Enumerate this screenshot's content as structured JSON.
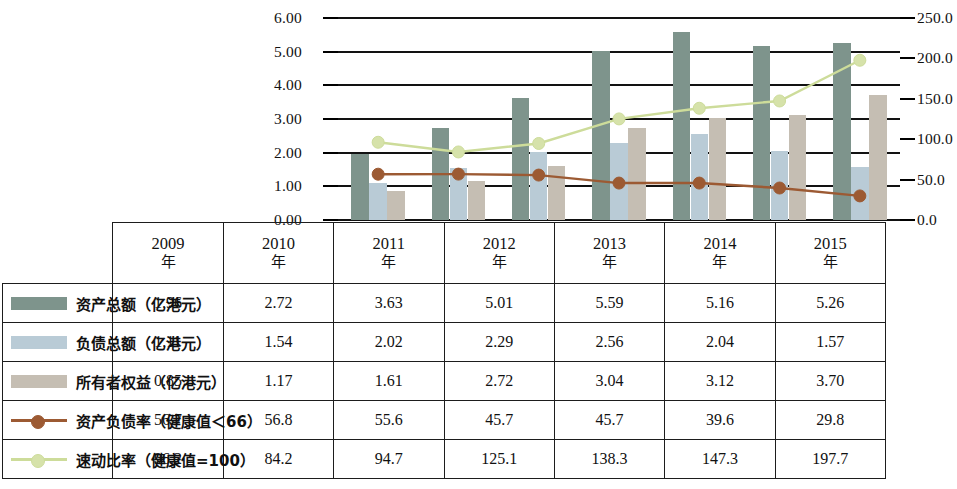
{
  "chart_data": {
    "type": "bar",
    "title": "",
    "xlabel": "",
    "ylabel": "",
    "grid": true,
    "legend_position": "table-left",
    "categories": [
      "2009年",
      "2010年",
      "2011年",
      "2012年",
      "2013年",
      "2014年",
      "2015年"
    ],
    "year_numbers": [
      "2009",
      "2010",
      "2011",
      "2012",
      "2013",
      "2014",
      "2015"
    ],
    "year_suffix": "年",
    "axes": {
      "left": {
        "min": 0,
        "max": 6,
        "step": 1,
        "ticks": [
          "0.00",
          "1.00",
          "2.00",
          "3.00",
          "4.00",
          "5.00",
          "6.00"
        ]
      },
      "right": {
        "min": 0,
        "max": 250,
        "step": 50,
        "ticks": [
          "0.0",
          "50.0",
          "100.0",
          "150.0",
          "200.0",
          "250.0"
        ]
      }
    },
    "series": [
      {
        "name": "资产总额（亿港元）",
        "kind": "bar",
        "axis": "left",
        "color": "#7e948c",
        "values": [
          1.96,
          2.72,
          3.63,
          5.01,
          5.59,
          5.16,
          5.26
        ],
        "labels": [
          "1.96",
          "2.72",
          "3.63",
          "5.01",
          "5.59",
          "5.16",
          "5.26"
        ]
      },
      {
        "name": "负债总额（亿港元）",
        "kind": "bar",
        "axis": "left",
        "color": "#b9cbd6",
        "values": [
          1.11,
          1.54,
          2.02,
          2.29,
          2.56,
          2.04,
          1.57
        ],
        "labels": [
          "1.11",
          "1.54",
          "2.02",
          "2.29",
          "2.56",
          "2.04",
          "1.57"
        ]
      },
      {
        "name": "所有者权益（亿港元）",
        "kind": "bar",
        "axis": "left",
        "color": "#c5beb3",
        "values": [
          0.85,
          1.17,
          1.61,
          2.72,
          3.04,
          3.12,
          3.7
        ],
        "labels": [
          "0.85",
          "1.17",
          "1.61",
          "2.72",
          "3.04",
          "3.12",
          "3.70"
        ]
      },
      {
        "name": "资产负债率（健康值＜66）",
        "kind": "line",
        "axis": "right",
        "color": "#9c5a33",
        "values": [
          56.7,
          56.8,
          55.6,
          45.7,
          45.7,
          39.6,
          29.8
        ],
        "labels": [
          "56.7",
          "56.8",
          "55.6",
          "45.7",
          "45.7",
          "39.6",
          "29.8"
        ]
      },
      {
        "name": "速动比率（健康值=100）",
        "kind": "line",
        "axis": "right",
        "color": "#d6e2aa",
        "values": [
          96.2,
          84.2,
          94.7,
          125.1,
          138.3,
          147.3,
          197.7
        ],
        "labels": [
          "96.2",
          "84.2",
          "94.7",
          "125.1",
          "138.3",
          "147.3",
          "197.7"
        ]
      }
    ]
  },
  "table": {
    "rows": [
      {
        "legend": "资产总额（亿港元）",
        "marker": "swatch-assets",
        "cells": [
          "1.96",
          "2.72",
          "3.63",
          "5.01",
          "5.59",
          "5.16",
          "5.26"
        ]
      },
      {
        "legend": "负债总额（亿港元）",
        "marker": "swatch-liabilities",
        "cells": [
          "1.11",
          "1.54",
          "2.02",
          "2.29",
          "2.56",
          "2.04",
          "1.57"
        ]
      },
      {
        "legend": "所有者权益（亿港元）",
        "marker": "swatch-equity",
        "cells": [
          "0.85",
          "1.17",
          "1.61",
          "2.72",
          "3.04",
          "3.12",
          "3.70"
        ]
      },
      {
        "legend": "资产负债率（健康值＜66）",
        "marker": "line-debt-ratio",
        "cells": [
          "56.7",
          "56.8",
          "55.6",
          "45.7",
          "45.7",
          "39.6",
          "29.8"
        ]
      },
      {
        "legend": "速动比率（健康值=100）",
        "marker": "line-quick-ratio",
        "cells": [
          "96.2",
          "84.2",
          "94.7",
          "125.1",
          "138.3",
          "147.3",
          "197.7"
        ]
      }
    ]
  }
}
